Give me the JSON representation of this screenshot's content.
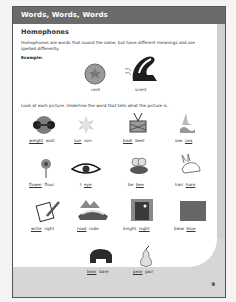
{
  "header": {
    "title": "Words, Words, Words"
  },
  "section": {
    "title": "Homophones",
    "intro": "Homophones are words that sound the same, but have different meanings and are spelled differently.",
    "example_label": "Example:",
    "examples": [
      {
        "picture": "cent-coin",
        "word": "cent"
      },
      {
        "picture": "skunk",
        "word": "scent"
      }
    ],
    "instruction": "Look at each picture.  Underline the word that tells what the picture is."
  },
  "items": [
    {
      "picture": "weight",
      "words": [
        "weight",
        "wait"
      ],
      "underlined": 0
    },
    {
      "picture": "sun",
      "words": [
        "sun",
        "son"
      ],
      "underlined": 0
    },
    {
      "picture": "drum",
      "words": [
        "beat",
        "beet"
      ],
      "underlined": 0
    },
    {
      "picture": "sea",
      "words": [
        "see",
        "sea"
      ],
      "underlined": 1
    },
    {
      "picture": "flower",
      "words": [
        "flower",
        "flour"
      ],
      "underlined": 0
    },
    {
      "picture": "eye",
      "words": [
        "I",
        "eye"
      ],
      "underlined": 1
    },
    {
      "picture": "bee",
      "words": [
        "be",
        "bee"
      ],
      "underlined": 1
    },
    {
      "picture": "hare",
      "words": [
        "hair",
        "hare"
      ],
      "underlined": 1
    },
    {
      "picture": "writing",
      "words": [
        "write",
        "right"
      ],
      "underlined": 0
    },
    {
      "picture": "road",
      "words": [
        "road",
        "rode"
      ],
      "underlined": 0
    },
    {
      "picture": "night-window",
      "words": [
        "knight",
        "night"
      ],
      "underlined": 1
    },
    {
      "picture": "blue-square",
      "words": [
        "blew",
        "blue"
      ],
      "underlined": 1
    },
    {
      "picture": "bear",
      "words": [
        "bear",
        "bare"
      ],
      "underlined": 0
    },
    {
      "picture": "pear",
      "words": [
        "pear",
        "pair"
      ],
      "underlined": 0
    }
  ],
  "footer": {
    "page_number": "9"
  },
  "colors": {
    "header": "#6b6b6b",
    "band": "#d6d6d6"
  }
}
